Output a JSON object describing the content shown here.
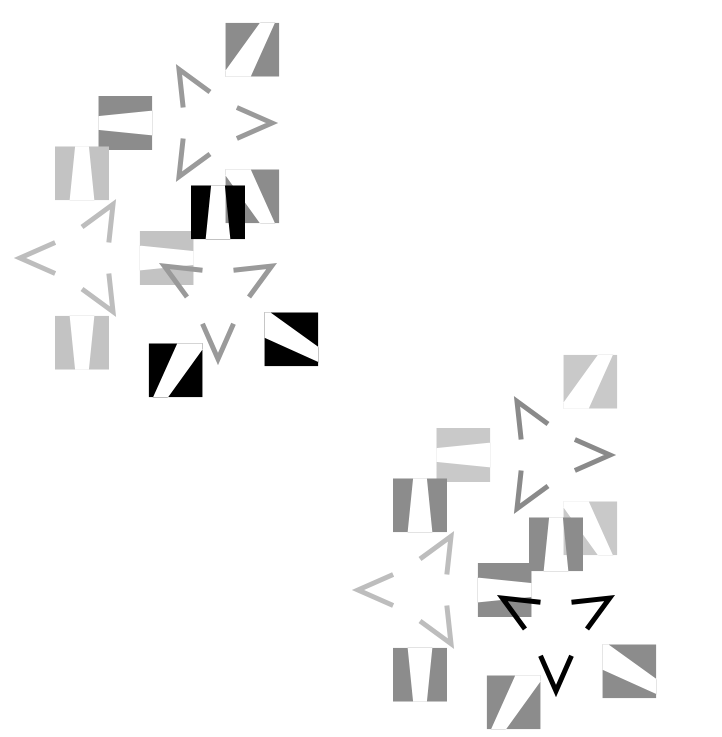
{
  "figure": {
    "title": "Illusory contour star figures",
    "background_color": "#ffffff",
    "width": 722,
    "height": 737,
    "blend_mode": "multiply",
    "square_size": 54,
    "star_outer_radius": 62,
    "star_inner_radius": 31,
    "chevron_stroke": 5
  },
  "palette": {
    "white": "#ffffff",
    "medium_gray": "#8c8c8c",
    "light_gray": "#c3c3c3",
    "pale_gray": "#cfcfcf",
    "dark_gray": "#7f7f7f",
    "black": "#000000",
    "chevron_medium": "#9a9a9a",
    "chevron_light": "#bdbdbd",
    "chevron_dark": "#8a8a8a"
  },
  "clusters": [
    {
      "name": "upper-left-cluster",
      "offset_x": 0,
      "offset_y": 0
    },
    {
      "name": "lower-right-cluster",
      "offset_x": 328,
      "offset_y": 352
    }
  ],
  "motifs": [
    {
      "name": "motif-upper-medium-gray",
      "cluster": "upper-left-cluster",
      "center_x": 210,
      "center_y": 123,
      "rotation_deg": 30,
      "square_color": "#8c8c8c",
      "chevron_color": "#9a9a9a",
      "square_angles": [
        270,
        150,
        30
      ],
      "chevron_angles": [
        210,
        330,
        90
      ],
      "label": "Motif A"
    },
    {
      "name": "motif-left-light-gray",
      "cluster": "upper-left-cluster",
      "center_x": 82,
      "center_y": 258,
      "rotation_deg": 0,
      "square_color": "#c3c3c3",
      "chevron_color": "#bdbdbd",
      "square_angles": [
        180,
        0,
        90
      ],
      "chevron_angles": [
        270,
        30,
        150
      ],
      "label": "Motif B"
    },
    {
      "name": "motif-lower-black",
      "cluster": "upper-left-cluster",
      "center_x": 218,
      "center_y": 297,
      "rotation_deg": 30,
      "square_color": "#000000",
      "chevron_color": "#9a9a9a",
      "square_angles": [
        210,
        0,
        120
      ],
      "chevron_angles": [
        300,
        60,
        180
      ],
      "label": "Motif C"
    },
    {
      "name": "motif-upper-pale-gray",
      "cluster": "lower-right-cluster",
      "center_x": 548,
      "center_y": 455,
      "rotation_deg": 30,
      "square_color": "#c9c9c9",
      "chevron_color": "#8a8a8a",
      "square_angles": [
        270,
        150,
        30
      ],
      "chevron_angles": [
        210,
        330,
        90
      ],
      "label": "Motif D"
    },
    {
      "name": "motif-left-mid-gray",
      "cluster": "lower-right-cluster",
      "center_x": 420,
      "center_y": 590,
      "rotation_deg": 0,
      "square_color": "#8c8c8c",
      "chevron_color": "#bdbdbd",
      "square_angles": [
        180,
        0,
        90
      ],
      "chevron_angles": [
        270,
        30,
        150
      ],
      "label": "Motif E"
    },
    {
      "name": "motif-lower-black-outline",
      "cluster": "lower-right-cluster",
      "center_x": 556,
      "center_y": 629,
      "rotation_deg": 30,
      "square_color": "#8c8c8c",
      "chevron_color": "#000000",
      "square_angles": [
        210,
        0,
        120
      ],
      "chevron_angles": [
        300,
        60,
        180
      ],
      "label": "Motif F"
    }
  ]
}
